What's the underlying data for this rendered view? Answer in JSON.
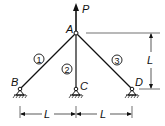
{
  "diagram": {
    "type": "three-bar truss",
    "load": {
      "label": "P",
      "direction": "up",
      "node": "A"
    },
    "nodes": {
      "A": {
        "label": "A"
      },
      "B": {
        "label": "B"
      },
      "C": {
        "label": "C"
      },
      "D": {
        "label": "D"
      }
    },
    "members": [
      {
        "id": "1",
        "label": "1",
        "from": "A",
        "to": "B"
      },
      {
        "id": "2",
        "label": "2",
        "from": "A",
        "to": "C"
      },
      {
        "id": "3",
        "label": "3",
        "from": "A",
        "to": "D"
      }
    ],
    "dimensions": {
      "height": {
        "label": "L"
      },
      "left_span": {
        "label": "L"
      },
      "right_span": {
        "label": "L"
      }
    },
    "colors": {
      "line": "#111111",
      "background": "#ffffff"
    }
  }
}
